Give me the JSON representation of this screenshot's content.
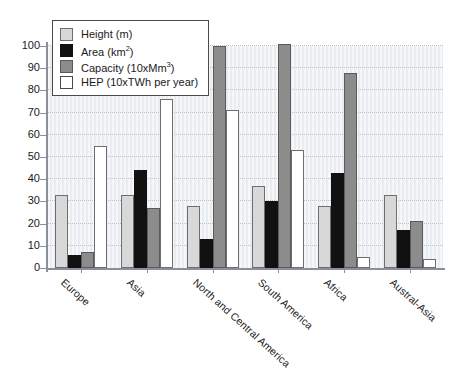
{
  "chart_data": {
    "type": "bar",
    "title": "",
    "subtitle": "",
    "xlabel": "",
    "ylabel": "",
    "ylim": [
      0,
      100
    ],
    "yticks": [
      0,
      10,
      20,
      30,
      40,
      50,
      60,
      70,
      80,
      90,
      100
    ],
    "grid": true,
    "legend_position": "top-left",
    "categories": [
      "Europe",
      "Asia",
      "North and Central America",
      "South America",
      "Africa",
      "Austral-Asia"
    ],
    "series": [
      {
        "name": "Height (m)",
        "unit": "m",
        "color": "#d8d8d8",
        "values": [
          33,
          33,
          28,
          37,
          28,
          33
        ]
      },
      {
        "name": "Area (km²)",
        "unit": "km2",
        "color": "#111111",
        "values": [
          6,
          44,
          13,
          30,
          43,
          17
        ]
      },
      {
        "name": "Capacity (10xMm³)",
        "unit": "10xMm3",
        "color": "#8c8c8c",
        "values": [
          7,
          27,
          100,
          101,
          88,
          21
        ]
      },
      {
        "name": "HEP (10xTWh per year)",
        "unit": "10xTWh per year",
        "color": "#ffffff",
        "values": [
          55,
          76,
          71,
          53,
          5,
          4
        ]
      }
    ]
  },
  "legend": {
    "items": [
      {
        "label_prefix": "Height (m)",
        "sup": "",
        "label_suffix": "",
        "swatch": "height"
      },
      {
        "label_prefix": "Area (km",
        "sup": "2",
        "label_suffix": ")",
        "swatch": "area"
      },
      {
        "label_prefix": "Capacity (10xMm",
        "sup": "3",
        "label_suffix": ")",
        "swatch": "capacity"
      },
      {
        "label_prefix": "HEP (10xTWh per year)",
        "sup": "",
        "label_suffix": "",
        "swatch": "hep"
      }
    ]
  },
  "colors": {
    "plot_background": "#e9edf1",
    "axis": "#8a9099",
    "gridline": "#b9c2cb",
    "text": "#1a1a1a",
    "page_background": "#ffffff"
  }
}
